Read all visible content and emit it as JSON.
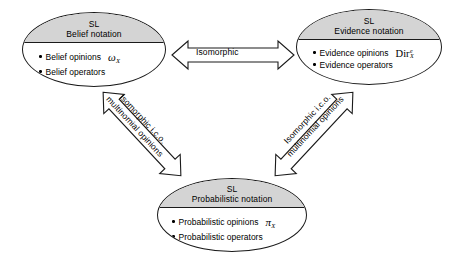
{
  "diagram": {
    "background_color": "#ffffff",
    "node_header_fill": "#d4d4d4",
    "outline_color": "#1a1a1a"
  },
  "nodes": {
    "belief": {
      "header_line1": "SL",
      "header_line2": "Belief notation",
      "items": [
        {
          "label": "Belief opinions",
          "symbol": "ω",
          "symbol_sub": "X"
        },
        {
          "label": "Belief operators",
          "symbol": "",
          "symbol_sub": ""
        }
      ]
    },
    "evidence": {
      "header_line1": "SL",
      "header_line2": "Evidence notation",
      "items": [
        {
          "label": "Evidence opinions",
          "symbol": "Dir",
          "symbol_sup": "e",
          "symbol_sub": "X"
        },
        {
          "label": "Evidence operators",
          "symbol": "",
          "symbol_sub": ""
        }
      ]
    },
    "probabilistic": {
      "header_line1": "SL",
      "header_line2": "Probabilistic notation",
      "items": [
        {
          "label": "Probabilistic opinions",
          "symbol": "π",
          "symbol_sub": "X"
        },
        {
          "label": "Probabilistic operators",
          "symbol": "",
          "symbol_sub": ""
        }
      ]
    }
  },
  "arrows": {
    "horizontal": {
      "label": "Isomorphic",
      "from": "belief",
      "to": "evidence",
      "style": "double-headed"
    },
    "left_diagonal": {
      "label_line1": "Isomorphic i.c.o.",
      "label_line2": "multinomial opinions",
      "from": "belief",
      "to": "probabilistic",
      "style": "double-headed"
    },
    "right_diagonal": {
      "label_line1": "Isomorphic i.c.o.",
      "label_line2": "multinomial opinions",
      "from": "evidence",
      "to": "probabilistic",
      "style": "double-headed"
    }
  }
}
